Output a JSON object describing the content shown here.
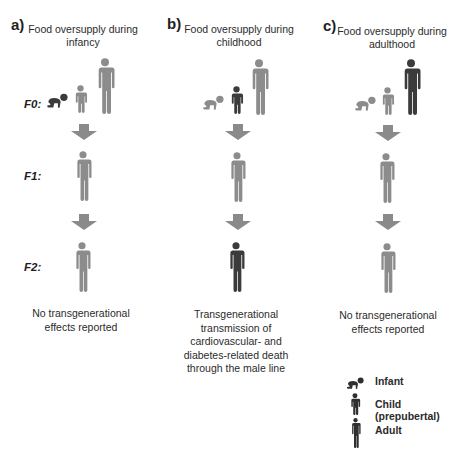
{
  "colors": {
    "gray_figure": "#8c8c8c",
    "dark_figure": "#3b3b3b",
    "arrow": "#8a8a8a",
    "text": "#2b2b2b"
  },
  "generation_labels": [
    "F0:",
    "F1:",
    "F2:"
  ],
  "panels": [
    {
      "letter": "a)",
      "title_line1": "Food oversupply during",
      "title_line2": "infancy",
      "f0": {
        "infant": "dark",
        "child": "gray",
        "adult": "gray"
      },
      "f1": "gray",
      "f2": "gray",
      "caption_lines": [
        "No transgenerational",
        "effects reported"
      ]
    },
    {
      "letter": "b)",
      "title_line1": "Food oversupply during",
      "title_line2": "childhood",
      "f0": {
        "infant": "gray",
        "child": "dark",
        "adult": "gray"
      },
      "f1": "gray",
      "f2": "dark",
      "caption_lines": [
        "Transgenerational",
        "transmission of",
        "cardiovascular- and",
        "diabetes-related death",
        "through the male line"
      ]
    },
    {
      "letter": "c)",
      "title_line1": "Food oversupply during",
      "title_line2": "adulthood",
      "f0": {
        "infant": "gray",
        "child": "gray",
        "adult": "dark"
      },
      "f1": "gray",
      "f2": "gray",
      "caption_lines": [
        "No transgenerational",
        "effects reported"
      ]
    }
  ],
  "legend": {
    "items": [
      {
        "icon": "infant-icon",
        "label": "Infant"
      },
      {
        "icon": "child-icon",
        "label": "Child (prepubertal)"
      },
      {
        "icon": "adult-icon",
        "label": "Adult"
      }
    ]
  }
}
